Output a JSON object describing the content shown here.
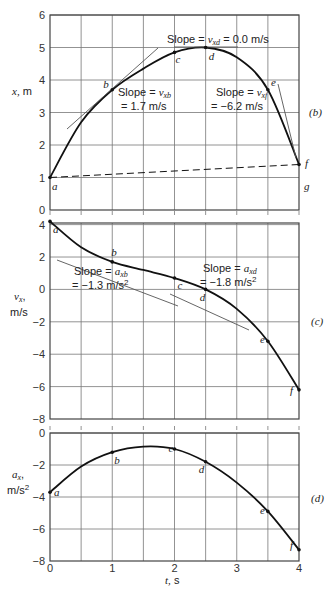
{
  "chart_data": [
    {
      "id": "b",
      "type": "line",
      "panel_label": "(b)",
      "title": "",
      "xlabel": "t, s",
      "ylabel": "x, m",
      "xlim": [
        0,
        4
      ],
      "ylim": [
        0,
        6
      ],
      "yticks": [
        "0",
        "1",
        "2",
        "3",
        "4",
        "5",
        "6"
      ],
      "grid": true,
      "series": [
        {
          "name": "x(t)",
          "x": [
            0,
            0.5,
            1,
            1.5,
            2,
            2.5,
            3,
            3.5,
            4
          ],
          "values": [
            1.0,
            2.7,
            3.7,
            4.35,
            4.85,
            5.0,
            4.7,
            3.7,
            1.4
          ]
        },
        {
          "name": "chord a-f (dashed)",
          "x": [
            0,
            4
          ],
          "values": [
            1.0,
            1.4
          ]
        }
      ],
      "points": [
        {
          "label": "a",
          "t": 0,
          "v": 1.0
        },
        {
          "label": "b",
          "t": 1,
          "v": 3.7
        },
        {
          "label": "c",
          "t": 2,
          "v": 4.85
        },
        {
          "label": "d",
          "t": 2.5,
          "v": 5.0
        },
        {
          "label": "e",
          "t": 3.5,
          "v": 3.7
        },
        {
          "label": "f",
          "t": 4,
          "v": 1.4
        },
        {
          "label": "g",
          "t": 4,
          "v": 1.0
        }
      ],
      "annotations": [
        {
          "text_prefix": "Slope = ",
          "sym": "v",
          "sub": "xd",
          "text_suffix": " = 0.0 m/s"
        },
        {
          "text_prefix": "Slope = ",
          "sym": "v",
          "sub": "xb",
          "line2": "= 1.7 m/s"
        },
        {
          "text_prefix": "Slope = ",
          "sym": "v",
          "sub": "xf",
          "line2": "= −6.2 m/s"
        }
      ]
    },
    {
      "id": "c",
      "type": "line",
      "panel_label": "(c)",
      "xlabel": "t, s",
      "ylabel": "vx, m/s",
      "xlim": [
        0,
        4
      ],
      "ylim": [
        -8,
        4
      ],
      "yticks": [
        "4",
        "2",
        "0",
        "−2",
        "−4",
        "−6",
        "−8"
      ],
      "grid": true,
      "series": [
        {
          "name": "vx(t)",
          "x": [
            0,
            0.5,
            1,
            1.5,
            2,
            2.5,
            3,
            3.5,
            4
          ],
          "values": [
            4.2,
            2.6,
            1.7,
            1.2,
            0.7,
            0.0,
            -1.2,
            -3.2,
            -6.2
          ]
        }
      ],
      "points": [
        {
          "label": "a",
          "t": 0,
          "v": 4.2
        },
        {
          "label": "b",
          "t": 1,
          "v": 1.7
        },
        {
          "label": "c",
          "t": 2,
          "v": 0.7
        },
        {
          "label": "d",
          "t": 2.5,
          "v": 0.0
        },
        {
          "label": "e",
          "t": 3.5,
          "v": -3.2
        },
        {
          "label": "f",
          "t": 4,
          "v": -6.2
        }
      ],
      "annotations": [
        {
          "text_prefix": "Slope = ",
          "sym": "a",
          "sub": "xb",
          "line2": "= −1.3 m/s²"
        },
        {
          "text_prefix": "Slope = ",
          "sym": "a",
          "sub": "xd",
          "line2": "= −1.8 m/s²"
        }
      ]
    },
    {
      "id": "d",
      "type": "line",
      "panel_label": "(d)",
      "xlabel": "t, s",
      "ylabel": "ax, m/s²",
      "xlim": [
        0,
        4
      ],
      "ylim": [
        -8,
        0
      ],
      "xticks": [
        "0",
        "1",
        "2",
        "3",
        "4"
      ],
      "yticks": [
        "0",
        "−2",
        "−4",
        "−6",
        "−8"
      ],
      "grid": true,
      "series": [
        {
          "name": "ax(t)",
          "x": [
            0,
            0.5,
            1,
            1.5,
            2,
            2.5,
            3,
            3.5,
            4
          ],
          "values": [
            -3.7,
            -2.1,
            -1.2,
            -0.85,
            -1.0,
            -1.8,
            -3.1,
            -4.9,
            -7.3
          ]
        }
      ],
      "points": [
        {
          "label": "a",
          "t": 0,
          "v": -3.7
        },
        {
          "label": "b",
          "t": 1,
          "v": -1.2
        },
        {
          "label": "c",
          "t": 2,
          "v": -1.0
        },
        {
          "label": "d",
          "t": 2.5,
          "v": -1.8
        },
        {
          "label": "e",
          "t": 3.5,
          "v": -4.9
        },
        {
          "label": "f",
          "t": 4,
          "v": -7.3
        }
      ]
    }
  ],
  "labels": {
    "panel_b": "(b)",
    "panel_c": "(c)",
    "panel_d": "(d)",
    "ylabel_b_sym": "x,",
    "ylabel_b_unit": "m",
    "ylabel_c_sym": "v",
    "ylabel_c_sub": "x",
    "ylabel_c_unit": "m/s",
    "ylabel_d_sym": "a",
    "ylabel_d_sub": "x",
    "ylabel_d_unit": "m/s",
    "ylabel_d_exp": "2",
    "xlabel_sym": "t,",
    "xlabel_unit": "s",
    "ann_b_d_1": "Slope = ",
    "ann_b_d_sym": "v",
    "ann_b_d_sub": "xd",
    "ann_b_d_2": " = 0.0 m/s",
    "ann_b_b_1": "Slope = ",
    "ann_b_b_sym": "v",
    "ann_b_b_sub": "xb",
    "ann_b_b_line2": "= 1.7 m/s",
    "ann_b_f_1": "Slope = ",
    "ann_b_f_sym": "v",
    "ann_b_f_sub": "xf",
    "ann_b_f_line2": "= −6.2 m/s",
    "ann_c_b_1": "Slope = ",
    "ann_c_b_sym": "a",
    "ann_c_b_sub": "xb",
    "ann_c_b_line2": "= −1.3 m/s",
    "ann_c_d_1": "Slope = ",
    "ann_c_d_sym": "a",
    "ann_c_d_sub": "xd",
    "ann_c_d_line2": "= −1.8 m/s",
    "sq": "2"
  },
  "colors": {
    "curve": "#111111",
    "grid": "#777777",
    "frame": "#444444",
    "tangent": "#555555"
  }
}
